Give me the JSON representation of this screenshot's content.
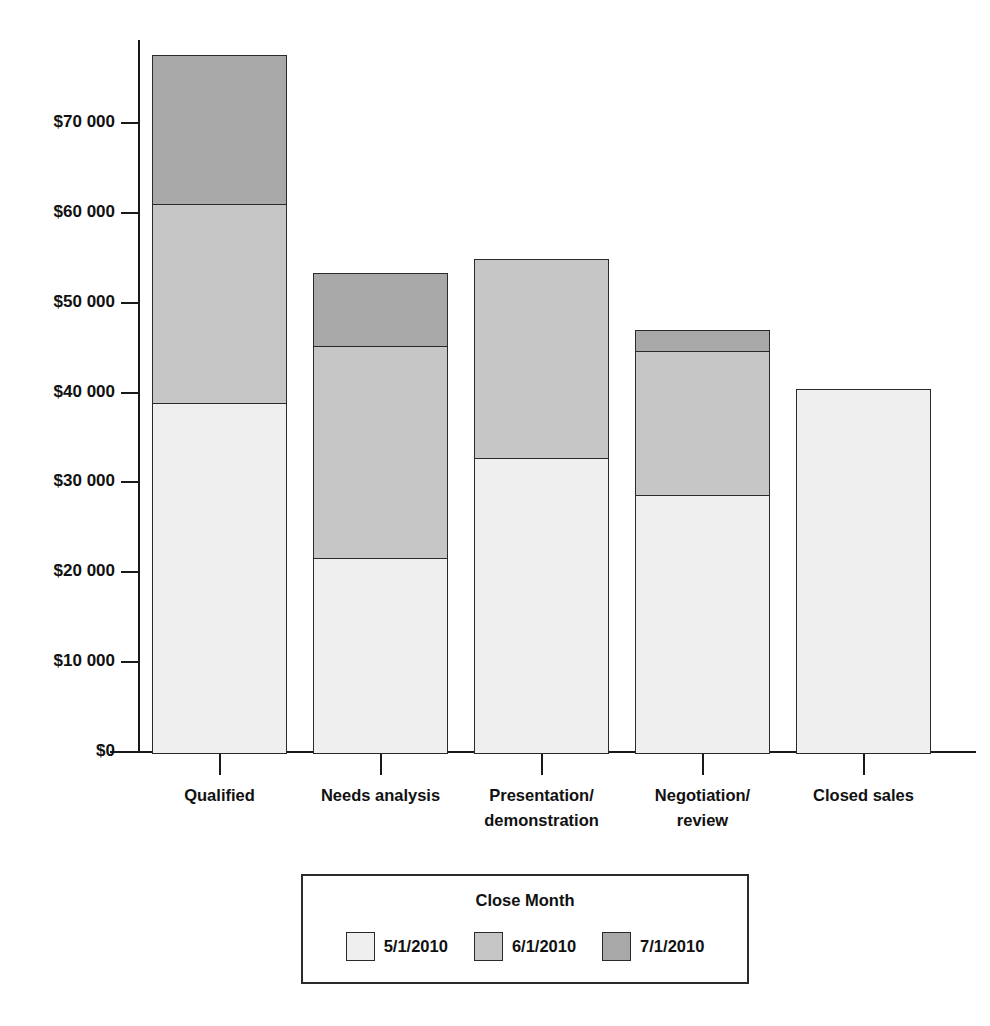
{
  "chart_data": {
    "type": "bar",
    "stacked": true,
    "title": "",
    "subtitle": "",
    "xlabel": "",
    "ylabel": "",
    "grid": false,
    "legend_position": "bottom",
    "legend_title": "Close Month",
    "categories": [
      "Qualified",
      "Presentation/ demonstration",
      "Needs analysis",
      "Negotiation/ review",
      "Closed sales"
    ],
    "category_lines": [
      [
        "Qualified"
      ],
      [
        "Needs analysis"
      ],
      [
        "Presentation/",
        "demonstration"
      ],
      [
        "Negotiation/",
        "review"
      ],
      [
        "Closed sales"
      ]
    ],
    "series": [
      {
        "name": "5/1/2010",
        "color": "#efefef",
        "values": [
          39000,
          21800,
          32900,
          28800,
          40600
        ]
      },
      {
        "name": "6/1/2010",
        "color": "#c6c6c6",
        "values": [
          22300,
          23700,
          22300,
          16200,
          0
        ]
      },
      {
        "name": "7/1/2010",
        "color": "#a8a8a8",
        "values": [
          16800,
          8300,
          0,
          2500,
          0
        ]
      }
    ],
    "totals": [
      78100,
      53800,
      55200,
      47500,
      40600
    ],
    "ylim": [
      0,
      78200
    ],
    "yticks": [
      0,
      10000,
      20000,
      30000,
      40000,
      50000,
      60000,
      70000
    ],
    "ytick_labels": [
      "$0",
      "$10 000",
      "$20 000",
      "$30 000",
      "$40 000",
      "$50 000",
      "$60 000",
      "$70 000"
    ]
  },
  "legend": {
    "title": "Close Month",
    "items": [
      {
        "label": "5/1/2010",
        "swatch": "s0"
      },
      {
        "label": "6/1/2010",
        "swatch": "s1"
      },
      {
        "label": "7/1/2010",
        "swatch": "s2"
      }
    ]
  },
  "colors": {
    "series_1": "#efefef",
    "series_2": "#c6c6c6",
    "series_3": "#a8a8a8",
    "axis": "#191919",
    "border": "#2a2a2a",
    "background": "#ffffff",
    "text": "#111111"
  }
}
